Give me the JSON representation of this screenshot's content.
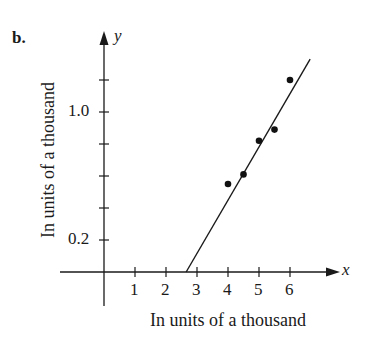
{
  "panel_label": "b.",
  "chart_data": {
    "type": "scatter",
    "title": "",
    "panel": "b.",
    "xlabel": "In units of a thousand",
    "ylabel": "In units of a thousand",
    "x_axis_name": "x",
    "y_axis_name": "y",
    "x_ticks": [
      1,
      2,
      3,
      4,
      5,
      6
    ],
    "x_tick_labels": [
      "1",
      "2",
      "3",
      "4",
      "5",
      "6"
    ],
    "y_ticks": [
      0.2,
      0.4,
      0.6,
      0.8,
      1.0,
      1.2
    ],
    "y_tick_labels": [
      "0.2",
      "",
      "",
      "",
      "1.0",
      ""
    ],
    "xlim": [
      -1,
      7.5
    ],
    "ylim": [
      -0.2,
      1.5
    ],
    "grid": false,
    "legend": null,
    "series": [
      {
        "name": "data points",
        "type": "scatter",
        "x": [
          4.0,
          4.5,
          5.0,
          5.5,
          6.0
        ],
        "y": [
          0.55,
          0.61,
          0.82,
          0.89,
          1.2
        ]
      },
      {
        "name": "fitted line",
        "type": "line",
        "x": [
          2.65,
          6.65
        ],
        "y": [
          0.0,
          1.33
        ]
      }
    ]
  }
}
